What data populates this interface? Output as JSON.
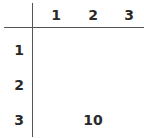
{
  "table": {
    "column_headers": [
      "1",
      "2",
      "3"
    ],
    "row_headers": [
      "1",
      "2",
      "3"
    ],
    "cells": [
      [
        "",
        "",
        ""
      ],
      [
        "",
        "",
        ""
      ],
      [
        "",
        "10",
        ""
      ]
    ]
  }
}
